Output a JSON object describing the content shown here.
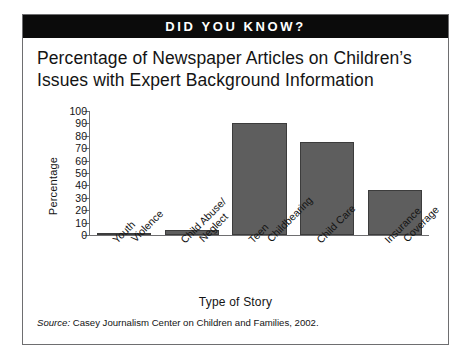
{
  "banner": {
    "text": "DID YOU KNOW?"
  },
  "title": {
    "line1": "Percentage of Newspaper Articles on Children’s",
    "line2": "Issues with Expert Background Information"
  },
  "source": {
    "prefix": "Source:",
    "text": "Casey Journalism Center on Children and Families, 2002."
  },
  "chart_data": {
    "type": "bar",
    "title": "Percentage of Newspaper Articles on Children’s Issues with Expert Background Information",
    "categories": [
      "Youth Violence",
      "Child Abuse/ Neglect",
      "Teen Childbearing",
      "Child Care",
      "Insurance Coverage"
    ],
    "category_lines": [
      [
        "Youth",
        "Violence"
      ],
      [
        "Child Abuse/",
        "Neglect"
      ],
      [
        "Teen",
        "Childbearing"
      ],
      [
        "Child Care",
        ""
      ],
      [
        "Insurance",
        "Coverage"
      ]
    ],
    "values": [
      2,
      4,
      90,
      75,
      36
    ],
    "xlabel": "Type of Story",
    "ylabel": "Percentage",
    "ylim": [
      0,
      100
    ],
    "ytick_step": 10,
    "yticks": [
      100,
      90,
      80,
      70,
      60,
      50,
      40,
      30,
      20,
      10,
      0
    ],
    "grid": false,
    "legend": "none",
    "bar_color": "#5e5e5e",
    "bar_edge_color": "#3c3c3c",
    "axis_color": "#6e6e70"
  }
}
